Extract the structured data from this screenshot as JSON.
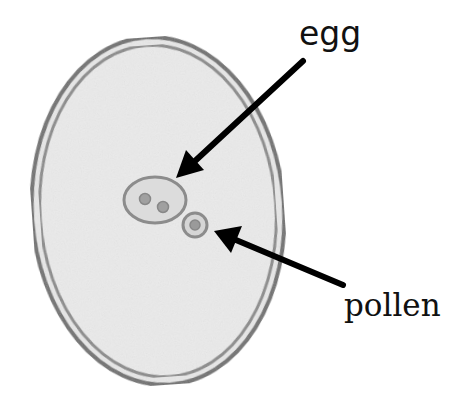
{
  "diagram": {
    "title": "",
    "labels": {
      "egg": "egg",
      "pollen": "pollen"
    },
    "components": [
      {
        "id": "ovule",
        "shape": "ellipse",
        "description": "large oval with double wall, speckled gray fill"
      },
      {
        "id": "egg",
        "shape": "ellipse",
        "description": "small oval containing two nuclei"
      },
      {
        "id": "pollen",
        "shape": "circle",
        "description": "small round cell beside egg with one nucleus"
      }
    ],
    "arrows": [
      {
        "from_label": "egg",
        "to": "egg",
        "start": [
          303,
          61
        ],
        "end": [
          177,
          177
        ]
      },
      {
        "from_label": "pollen",
        "to": "pollen",
        "start": [
          343,
          285
        ],
        "end": [
          215,
          232
        ]
      }
    ],
    "colors": {
      "wall": "#6e6e6e",
      "fill": "#e6e6e6",
      "cell_wall": "#8a8a8a",
      "nucleus": "#8f8f8f",
      "arrow": "#000000",
      "text": "#111111"
    }
  }
}
